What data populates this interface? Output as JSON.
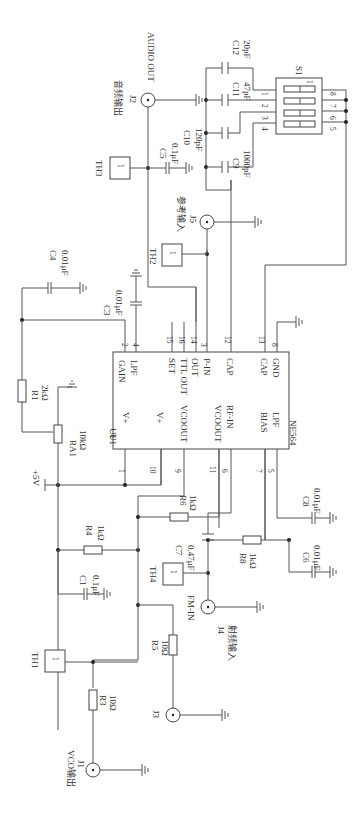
{
  "diagram": {
    "type": "circuit-schematic",
    "orientation": "rotated 90 degrees clockwise",
    "ic": {
      "ref": "U1",
      "part": "NE564",
      "top_pins": [
        {
          "num": "2",
          "name": "GAIN"
        },
        {
          "num": "4",
          "name": "LPF"
        },
        {
          "num": "15",
          "name": "SET"
        },
        {
          "num": "16",
          "name": "TTL OUT"
        },
        {
          "num": "14",
          "name": "OUT"
        },
        {
          "num": "3",
          "name": "P-IN"
        },
        {
          "num": "12",
          "name": "CAP"
        },
        {
          "num": "13",
          "name": "CAP"
        },
        {
          "num": "8",
          "name": "GND"
        }
      ],
      "bottom_pins": [
        {
          "num": "1",
          "name": "V+"
        },
        {
          "num": "10",
          "name": "V+"
        },
        {
          "num": "9",
          "name": "VCOOUT"
        },
        {
          "num": "11",
          "name": "VCOOUT"
        },
        {
          "num": "6",
          "name": "RF-IN"
        },
        {
          "num": "7",
          "name": "BIAS"
        },
        {
          "num": "5",
          "name": "LPF"
        }
      ]
    },
    "resistors": [
      {
        "ref": "R1",
        "value": "2kΩ"
      },
      {
        "ref": "RA1",
        "value": "10kΩ"
      },
      {
        "ref": "R3",
        "value": "10Ω"
      },
      {
        "ref": "R4",
        "value": "1kΩ"
      },
      {
        "ref": "R5",
        "value": "10Ω"
      },
      {
        "ref": "R6",
        "value": "1kΩ"
      },
      {
        "ref": "R8",
        "value": "1kΩ"
      }
    ],
    "capacitors": [
      {
        "ref": "C1",
        "value": "0.1μF"
      },
      {
        "ref": "C3",
        "value": "0.01μF"
      },
      {
        "ref": "C4",
        "value": "0.01μF"
      },
      {
        "ref": "C5",
        "value": "0.1μF"
      },
      {
        "ref": "C6",
        "value": "0.01μF"
      },
      {
        "ref": "C7",
        "value": "0.47μF"
      },
      {
        "ref": "C8",
        "value": "0.01μF"
      },
      {
        "ref": "C9",
        "value": "1000pF"
      },
      {
        "ref": "C10",
        "value": "120pF"
      },
      {
        "ref": "C11",
        "value": "47pF"
      },
      {
        "ref": "C12",
        "value": "20pF"
      }
    ],
    "connectors": [
      {
        "ref": "J1",
        "label": "VCO输出"
      },
      {
        "ref": "J2",
        "label": "音频输出",
        "label2": "AUDIO OUT"
      },
      {
        "ref": "J3",
        "label": ""
      },
      {
        "ref": "J4",
        "label": "射频输入",
        "label2": "FM-IN"
      },
      {
        "ref": "J5",
        "label": "参考输入"
      }
    ],
    "test_points": [
      {
        "ref": "TH1",
        "pin": "1"
      },
      {
        "ref": "TH2",
        "pin": "1"
      },
      {
        "ref": "TH3",
        "pin": "1"
      },
      {
        "ref": "TH4",
        "pin": "1"
      }
    ],
    "switch": {
      "ref": "S1",
      "pins_left": [
        "1",
        "2",
        "3",
        "4"
      ],
      "pins_right": [
        "8",
        "7",
        "6",
        "5"
      ],
      "pin1_mark": "1"
    },
    "supply": {
      "label": "+5V"
    }
  }
}
